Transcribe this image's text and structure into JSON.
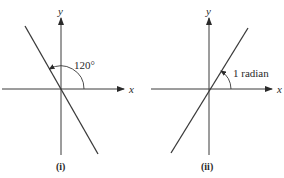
{
  "figures": [
    {
      "caption": "(i)",
      "x_axis_label": "x",
      "y_axis_label": "y",
      "angle_label": "120°",
      "angle_degrees": 120
    },
    {
      "caption": "(ii)",
      "x_axis_label": "x",
      "y_axis_label": "y",
      "angle_label": "1 radian",
      "angle_radians": 1
    }
  ],
  "colors": {
    "line": "#3a3a3a",
    "text": "#2a2a2a"
  }
}
